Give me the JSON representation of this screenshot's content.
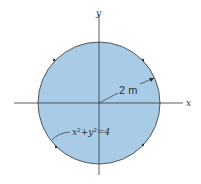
{
  "diagram": {
    "x_axis_label": "x",
    "y_axis_label": "y",
    "radius_label": "2 m",
    "equation_label": "x²+y²=4",
    "fill_color": "#a8cbe6",
    "stroke_color": "#333333"
  }
}
